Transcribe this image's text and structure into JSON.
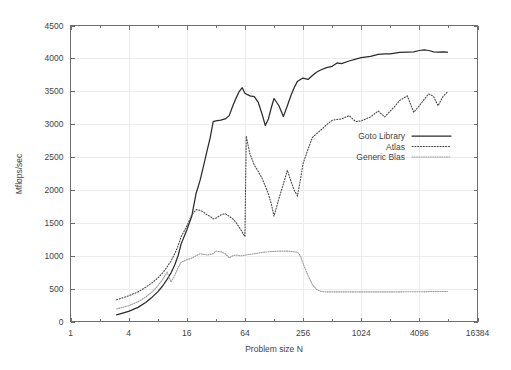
{
  "chart_data": {
    "type": "line",
    "title": "",
    "xlabel": "Problem size N",
    "ylabel": "Mflops/sec",
    "xscale": "log2",
    "yscale": "linear",
    "xlim": [
      1,
      16384
    ],
    "ylim": [
      0,
      4500
    ],
    "xticks": [
      1,
      4,
      16,
      64,
      256,
      1024,
      4096,
      16384
    ],
    "xtick_labels": [
      "1",
      "4",
      "16",
      "64",
      "256",
      "1024",
      "4096",
      "16384"
    ],
    "yticks": [
      0,
      500,
      1000,
      1500,
      2000,
      2500,
      3000,
      3500,
      4000,
      4500
    ],
    "ytick_labels": [
      "0",
      "500",
      "1000",
      "1500",
      "2000",
      "2500",
      "3000",
      "3500",
      "4000",
      "4500"
    ],
    "grid": true,
    "legend_position": "center-right",
    "series": [
      {
        "name": "Goto Library",
        "style": "solid",
        "color": "#2b2b2b",
        "x": [
          3,
          4,
          5,
          6,
          7,
          8,
          9,
          10,
          11,
          12,
          13,
          14,
          16,
          18,
          20,
          22,
          24,
          26,
          28,
          30,
          32,
          36,
          40,
          44,
          48,
          52,
          56,
          60,
          64,
          72,
          80,
          88,
          96,
          104,
          112,
          120,
          128,
          144,
          160,
          176,
          192,
          208,
          224,
          240,
          256,
          288,
          320,
          352,
          384,
          448,
          512,
          576,
          640,
          768,
          896,
          1024,
          1280,
          1536,
          1792,
          2048,
          2560,
          3072,
          3584,
          4096,
          4608,
          5120,
          5760,
          6400,
          7200,
          8000
        ],
        "y": [
          100,
          155,
          215,
          290,
          370,
          450,
          540,
          640,
          740,
          860,
          1000,
          1180,
          1390,
          1600,
          1950,
          2150,
          2380,
          2600,
          2800,
          3040,
          3050,
          3060,
          3080,
          3130,
          3280,
          3400,
          3500,
          3555,
          3470,
          3430,
          3420,
          3330,
          3160,
          2980,
          3080,
          3250,
          3390,
          3280,
          3115,
          3280,
          3440,
          3560,
          3650,
          3680,
          3700,
          3680,
          3740,
          3790,
          3820,
          3860,
          3880,
          3930,
          3920,
          3960,
          3990,
          4010,
          4030,
          4060,
          4070,
          4070,
          4090,
          4095,
          4100,
          4120,
          4130,
          4120,
          4100,
          4095,
          4100,
          4095
        ]
      },
      {
        "name": "Atlas",
        "style": "dotted",
        "color": "#4a4a4a",
        "x": [
          3,
          4,
          5,
          6,
          7,
          8,
          9,
          10,
          11,
          12,
          13,
          14,
          16,
          18,
          20,
          22,
          24,
          26,
          28,
          30,
          32,
          36,
          40,
          44,
          48,
          52,
          56,
          60,
          64,
          66,
          72,
          80,
          88,
          96,
          104,
          112,
          120,
          128,
          144,
          160,
          176,
          192,
          208,
          224,
          240,
          256,
          288,
          320,
          384,
          448,
          512,
          640,
          768,
          896,
          1024,
          1280,
          1536,
          1792,
          2048,
          2304,
          2560,
          3072,
          3584,
          4096,
          4608,
          5120,
          5760,
          6400,
          7200,
          8000
        ],
        "y": [
          330,
          390,
          450,
          520,
          590,
          660,
          740,
          830,
          920,
          1030,
          1150,
          1290,
          1450,
          1620,
          1700,
          1690,
          1660,
          1620,
          1600,
          1560,
          1570,
          1620,
          1640,
          1600,
          1560,
          1500,
          1430,
          1360,
          1290,
          2820,
          2550,
          2380,
          2280,
          2180,
          2060,
          1940,
          1790,
          1600,
          1870,
          2090,
          2300,
          2130,
          1990,
          1910,
          2150,
          2400,
          2620,
          2800,
          2900,
          2990,
          3060,
          3080,
          3130,
          3040,
          3050,
          3110,
          3200,
          3110,
          3200,
          3280,
          3360,
          3430,
          3180,
          3280,
          3380,
          3460,
          3420,
          3280,
          3420,
          3490
        ]
      },
      {
        "name": "Generic Blas",
        "style": "dotted-fine",
        "color": "#9a9a9a",
        "x": [
          3,
          4,
          5,
          6,
          7,
          8,
          9,
          10,
          11,
          12,
          13,
          14,
          16,
          18,
          20,
          22,
          24,
          26,
          28,
          30,
          32,
          36,
          40,
          44,
          48,
          52,
          56,
          60,
          64,
          72,
          80,
          88,
          96,
          104,
          112,
          120,
          128,
          144,
          160,
          176,
          192,
          208,
          224,
          240,
          256,
          288,
          320,
          352,
          384,
          448,
          512,
          640,
          768,
          896,
          1024,
          1280,
          1536,
          2048,
          2560,
          3072,
          3584,
          4096,
          5120,
          6400,
          8000
        ],
        "y": [
          190,
          240,
          300,
          370,
          450,
          540,
          640,
          750,
          600,
          700,
          820,
          900,
          940,
          960,
          1000,
          1030,
          1020,
          1010,
          1020,
          1030,
          1070,
          1060,
          1030,
          970,
          1000,
          1010,
          1000,
          1000,
          1010,
          1020,
          1030,
          1040,
          1050,
          1055,
          1060,
          1065,
          1065,
          1070,
          1070,
          1070,
          1065,
          1060,
          1055,
          1000,
          880,
          700,
          560,
          490,
          460,
          450,
          450,
          450,
          450,
          450,
          450,
          450,
          450,
          450,
          450,
          452,
          452,
          452,
          455,
          455,
          455
        ]
      }
    ]
  },
  "legend": {
    "entries": [
      {
        "label": "Goto Library",
        "style": "solid"
      },
      {
        "label": "Atlas",
        "style": "dotted"
      },
      {
        "label": "Generic Blas",
        "style": "dotted-fine"
      }
    ]
  }
}
